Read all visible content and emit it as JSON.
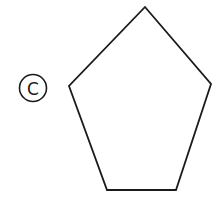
{
  "label": {
    "text": "C",
    "style": "circled",
    "cx": 33,
    "cy": 88,
    "r": 13.5
  },
  "shape": {
    "type": "pentagon",
    "points": "145,7 211,84 176,190 107,190 69,86",
    "stroke": "#1a1a1a",
    "fill": "none"
  }
}
